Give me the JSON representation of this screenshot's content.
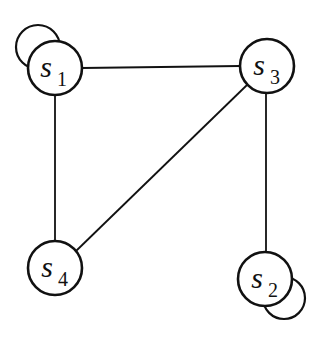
{
  "diagram": {
    "type": "graph",
    "nodes": [
      {
        "id": "s1",
        "base": "s",
        "sub": "1",
        "x": 55,
        "y": 68,
        "self_loop": true
      },
      {
        "id": "s3",
        "base": "s",
        "sub": "3",
        "x": 267,
        "y": 66,
        "self_loop": false
      },
      {
        "id": "s4",
        "base": "s",
        "sub": "4",
        "x": 55,
        "y": 268,
        "self_loop": false
      },
      {
        "id": "s2",
        "base": "s",
        "sub": "2",
        "x": 265,
        "y": 279,
        "self_loop": true
      }
    ],
    "edges": [
      {
        "from": "s1",
        "to": "s3"
      },
      {
        "from": "s1",
        "to": "s4"
      },
      {
        "from": "s3",
        "to": "s4"
      },
      {
        "from": "s3",
        "to": "s2"
      },
      {
        "from": "s1",
        "to": "s1"
      },
      {
        "from": "s2",
        "to": "s2"
      }
    ],
    "stroke_color": "#111111",
    "fill_color": "#ffffff"
  }
}
